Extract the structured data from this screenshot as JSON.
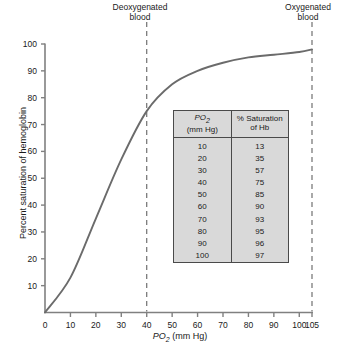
{
  "figure": {
    "annotations": [
      {
        "name": "deoxygenated-blood",
        "line1": "Deoxygenated",
        "line2": "blood",
        "po2": 40
      },
      {
        "name": "oxygenated-blood",
        "line1": "Oxygenated",
        "line2": "blood",
        "po2": 105
      }
    ],
    "colors": {
      "curve": "#6b6b6b",
      "axis": "#808080",
      "dashed": "#707070",
      "table_fill": "#d9d9d9",
      "table_border": "#4a4a4a",
      "text": "#1a1a1a"
    }
  },
  "axes": {
    "y": {
      "label_prefix": "Percent saturation of hemoglobin",
      "ticks": [
        0,
        10,
        20,
        30,
        40,
        50,
        60,
        70,
        80,
        90,
        100
      ],
      "tick_labels": [
        "",
        "10",
        "20",
        "30",
        "40",
        "50",
        "60",
        "70",
        "80",
        "90",
        "100"
      ]
    },
    "x": {
      "label_main": "PO",
      "label_sub": "2",
      "label_units": " (mm Hg)",
      "ticks": [
        0,
        10,
        20,
        30,
        40,
        50,
        60,
        70,
        80,
        90,
        100,
        105
      ],
      "tick_labels": [
        "0",
        "10",
        "20",
        "30",
        "40",
        "50",
        "60",
        "70",
        "80",
        "90",
        "100",
        "105"
      ]
    }
  },
  "table": {
    "header": {
      "col1_line1_main": "PO",
      "col1_line1_sub": "2",
      "col1_line2": "(mm Hg)",
      "col2_line1": "% Saturation",
      "col2_line2": "of Hb"
    },
    "rows": [
      {
        "po2": "10",
        "sat": "13"
      },
      {
        "po2": "20",
        "sat": "35"
      },
      {
        "po2": "30",
        "sat": "57"
      },
      {
        "po2": "40",
        "sat": "75"
      },
      {
        "po2": "50",
        "sat": "85"
      },
      {
        "po2": "60",
        "sat": "90"
      },
      {
        "po2": "70",
        "sat": "93"
      },
      {
        "po2": "80",
        "sat": "95"
      },
      {
        "po2": "90",
        "sat": "96"
      },
      {
        "po2": "100",
        "sat": "97"
      }
    ]
  },
  "chart_data": {
    "type": "line",
    "title": "",
    "xlabel": "PO2 (mm Hg)",
    "ylabel": "Percent saturation of hemoglobin",
    "xlim": [
      0,
      105
    ],
    "ylim": [
      0,
      100
    ],
    "grid": false,
    "legend": "none",
    "x": [
      0,
      10,
      20,
      30,
      40,
      50,
      60,
      70,
      80,
      90,
      100,
      105
    ],
    "y": [
      0,
      13,
      35,
      57,
      75,
      85,
      90,
      93,
      95,
      96,
      97,
      98
    ],
    "series": [
      {
        "name": "Oxygen-hemoglobin dissociation curve",
        "x": [
          0,
          10,
          20,
          30,
          40,
          50,
          60,
          70,
          80,
          90,
          100,
          105
        ],
        "values": [
          0,
          13,
          35,
          57,
          75,
          85,
          90,
          93,
          95,
          96,
          97,
          98
        ]
      }
    ],
    "annotations": [
      {
        "text": "Deoxygenated blood",
        "x": 40,
        "type": "vertical-dashed-line"
      },
      {
        "text": "Oxygenated blood",
        "x": 105,
        "type": "vertical-dashed-line"
      }
    ]
  }
}
